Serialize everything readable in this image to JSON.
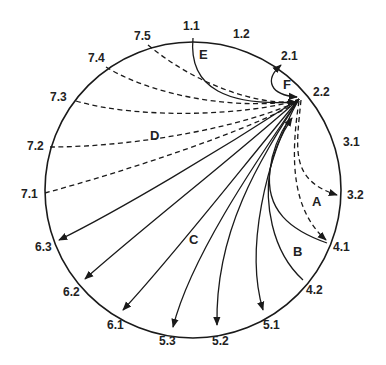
{
  "diagram": {
    "type": "circular transition diagram",
    "circle": {
      "cx": 193,
      "cy": 190,
      "r": 148
    },
    "hub": "2.2",
    "point_labels": [
      {
        "id": "1.1",
        "x": 193,
        "y": 37,
        "lx": 183,
        "ly": 30
      },
      {
        "id": "1.2",
        "x": 243,
        "y": 40,
        "lx": 233,
        "ly": 38
      },
      {
        "id": "2.1",
        "x": 283,
        "y": 63,
        "lx": 281,
        "ly": 60
      },
      {
        "id": "2.2",
        "x": 300,
        "y": 97,
        "lx": 318,
        "ly": 96
      },
      {
        "id": "3.1",
        "x": 330,
        "y": 140,
        "lx": 343,
        "ly": 146
      },
      {
        "id": "3.2",
        "x": 340,
        "y": 195,
        "lx": 347,
        "ly": 199
      },
      {
        "id": "4.1",
        "x": 328,
        "y": 243,
        "lx": 333,
        "ly": 251
      },
      {
        "id": "4.2",
        "x": 303,
        "y": 280,
        "lx": 306,
        "ly": 294
      },
      {
        "id": "5.1",
        "x": 262,
        "y": 311,
        "lx": 263,
        "ly": 329
      },
      {
        "id": "5.2",
        "x": 216,
        "y": 326,
        "lx": 212,
        "ly": 345
      },
      {
        "id": "5.3",
        "x": 172,
        "y": 328,
        "lx": 159,
        "ly": 345
      },
      {
        "id": "6.1",
        "x": 122,
        "y": 311,
        "lx": 107,
        "ly": 329
      },
      {
        "id": "6.2",
        "x": 84,
        "y": 280,
        "lx": 63,
        "ly": 296
      },
      {
        "id": "6.3",
        "x": 58,
        "y": 241,
        "lx": 35,
        "ly": 251
      },
      {
        "id": "7.1",
        "x": 45,
        "y": 193,
        "lx": 21,
        "ly": 198
      },
      {
        "id": "7.2",
        "x": 50,
        "y": 147,
        "lx": 27,
        "ly": 150
      },
      {
        "id": "7.3",
        "x": 76,
        "y": 101,
        "lx": 50,
        "ly": 101
      },
      {
        "id": "7.4",
        "x": 106,
        "y": 67,
        "lx": 88,
        "ly": 62
      },
      {
        "id": "7.5",
        "x": 148,
        "y": 45,
        "lx": 134,
        "ly": 40
      }
    ],
    "region_labels": [
      {
        "id": "A",
        "x": 317,
        "y": 206
      },
      {
        "id": "B",
        "x": 298,
        "y": 256
      },
      {
        "id": "C",
        "x": 193,
        "y": 244
      },
      {
        "id": "D",
        "x": 155,
        "y": 140
      },
      {
        "id": "E",
        "x": 199,
        "y": 59
      },
      {
        "id": "F",
        "x": 288,
        "y": 89
      }
    ],
    "edges": {
      "E_solid_from_1.1_to_2.2": {
        "from": "1.1",
        "to": "2.2",
        "style": "solid",
        "arrow": "end"
      },
      "F_loop_from_2.2_to_2.1": {
        "from": "2.2",
        "to": "2.1",
        "style": "solid",
        "arrow": "both"
      },
      "D_dashed_to_hub": [
        "7.1",
        "7.2",
        "7.3",
        "7.4",
        "7.5"
      ],
      "C_solid_from_hub": [
        "6.3",
        "6.2",
        "6.1",
        "5.3",
        "5.2",
        "5.1"
      ],
      "B_solid_to_hub": [
        "4.1",
        "4.2"
      ],
      "A_dashed_from_hub": [
        "3.2",
        "4.1"
      ]
    }
  }
}
